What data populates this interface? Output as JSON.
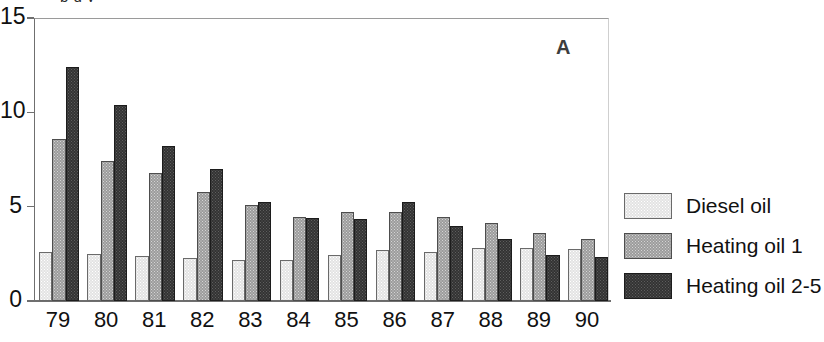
{
  "figure": {
    "panel_label": "A",
    "caption_sliver": "p g y"
  },
  "legend": {
    "items": [
      {
        "label": "Diesel oil",
        "key": "diesel",
        "color": "#e3e3e3"
      },
      {
        "label": "Heating oil 1",
        "key": "heating1",
        "color": "#9c9c9c"
      },
      {
        "label": "Heating oil 2-5",
        "key": "heating25",
        "color": "#333333"
      }
    ]
  },
  "chart_data": {
    "type": "bar",
    "title": "",
    "xlabel": "",
    "ylabel": "",
    "ylim": [
      0,
      15
    ],
    "yticks": [
      0,
      5,
      10,
      15
    ],
    "grid": false,
    "legend_position": "right",
    "categories": [
      "79",
      "80",
      "81",
      "82",
      "83",
      "84",
      "85",
      "86",
      "87",
      "88",
      "89",
      "90"
    ],
    "series": [
      {
        "name": "Diesel oil",
        "color": "#e3e3e3",
        "values": [
          2.6,
          2.5,
          2.4,
          2.3,
          2.2,
          2.2,
          2.45,
          2.7,
          2.6,
          2.8,
          2.8,
          2.75
        ]
      },
      {
        "name": "Heating oil 1",
        "color": "#9c9c9c",
        "values": [
          8.6,
          7.4,
          6.8,
          5.8,
          5.1,
          4.45,
          4.7,
          4.7,
          4.45,
          4.15,
          3.6,
          3.3
        ]
      },
      {
        "name": "Heating oil 2-5",
        "color": "#333333",
        "values": [
          12.4,
          10.4,
          8.2,
          7.0,
          5.25,
          4.4,
          4.35,
          5.25,
          4.0,
          3.3,
          2.45,
          2.35
        ]
      }
    ]
  }
}
